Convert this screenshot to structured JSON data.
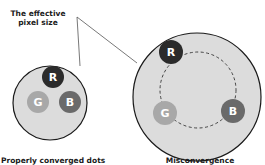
{
  "labels": {
    "callout_line1": "The effective",
    "callout_line2": "pixel size",
    "left_caption": "Properly converged dots",
    "right_caption": "Misconvergence"
  },
  "dots": {
    "red_letter": "R",
    "green_letter": "G",
    "blue_letter": "B"
  },
  "colors": {
    "background": "#ffffff",
    "pixel_fill": "#dcdcdc",
    "outline": "#1a1a1a",
    "red_dot": "#2b2b2b",
    "green_dot": "#a8a8a8",
    "blue_dot": "#6a6a6a",
    "dashed_path": "#444444"
  }
}
